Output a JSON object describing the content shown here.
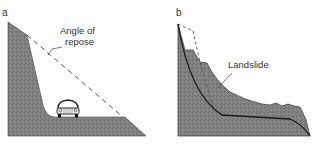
{
  "panels": [
    {
      "id": "a",
      "label": "a",
      "annotation": "Angle of repose",
      "annotation_lines": [
        "Angle of",
        "repose"
      ]
    },
    {
      "id": "b",
      "label": "b",
      "annotation": "Landslide"
    }
  ],
  "colors": {
    "rock_fill": "#7d7d7d",
    "outline": "#222222",
    "dashed": "#555555",
    "text": "#333333"
  }
}
